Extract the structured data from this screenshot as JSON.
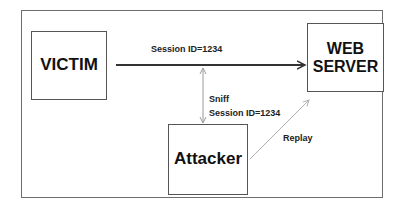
{
  "diagram": {
    "nodes": {
      "victim": {
        "label": "VICTIM"
      },
      "server": {
        "line1": "WEB",
        "line2": "SERVER"
      },
      "attacker": {
        "label": "Attacker"
      }
    },
    "edges": {
      "session": {
        "label": "Session ID=1234",
        "from": "VICTIM",
        "to": "WEB SERVER"
      },
      "sniff": {
        "line1": "Sniff",
        "line2": "Session ID=1234",
        "from": "Attacker",
        "to": "Session"
      },
      "replay": {
        "label": "Replay",
        "from": "Attacker",
        "to": "WEB SERVER"
      }
    },
    "colors": {
      "main_arrow": "#333333",
      "sniff_arrow": "#9a9a9a",
      "replay_arrow": "#b0b0b0",
      "box_border": "#555555",
      "frame_border": "#6e6e6e"
    }
  }
}
